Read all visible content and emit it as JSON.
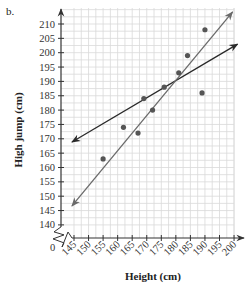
{
  "part_label": "b.",
  "chart_data": {
    "type": "scatter",
    "title": "",
    "xlabel": "Height (cm)",
    "ylabel": "High jump (cm)",
    "xlim": [
      145,
      200
    ],
    "ylim": [
      140,
      210
    ],
    "x_ticks": [
      145,
      150,
      155,
      160,
      165,
      170,
      175,
      180,
      185,
      190,
      195,
      200
    ],
    "y_ticks": [
      140,
      145,
      150,
      155,
      160,
      165,
      170,
      175,
      180,
      185,
      190,
      195,
      200,
      205,
      210
    ],
    "x_tick_labels": [
      "145",
      "150",
      "155",
      "160",
      "165",
      "170",
      "175",
      "180",
      "185",
      "190",
      "195",
      "200"
    ],
    "y_tick_labels": [
      "140",
      "145",
      "150",
      "155",
      "160",
      "165",
      "170",
      "175",
      "180",
      "185",
      "190",
      "195",
      "200",
      "205",
      "210"
    ],
    "origin_label": "0",
    "axis_break": true,
    "grid": true,
    "points": [
      {
        "x": 155,
        "y": 163
      },
      {
        "x": 162,
        "y": 174
      },
      {
        "x": 167,
        "y": 172
      },
      {
        "x": 169,
        "y": 184
      },
      {
        "x": 172,
        "y": 180
      },
      {
        "x": 176,
        "y": 188
      },
      {
        "x": 181,
        "y": 193
      },
      {
        "x": 184,
        "y": 199
      },
      {
        "x": 189,
        "y": 186
      },
      {
        "x": 190,
        "y": 208
      }
    ],
    "lines": [
      {
        "name": "line-shallow",
        "color": "#2a2a2a",
        "x1": 144.3,
        "y1": 168.9,
        "x2": 201.2,
        "y2": 203.0,
        "arrows": "both"
      },
      {
        "name": "line-steep",
        "color": "#6a6a6a",
        "x1": 144.3,
        "y1": 146.6,
        "x2": 199.5,
        "y2": 214.2,
        "arrows": "both"
      }
    ],
    "colors": {
      "grid": "#d9d9d9",
      "axis": "#333333",
      "point": "#555555"
    }
  }
}
